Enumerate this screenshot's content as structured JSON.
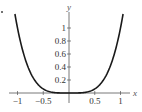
{
  "chart_data": {
    "type": "line",
    "title": "",
    "xlabel": "x",
    "ylabel": "y",
    "function": "y = x^4",
    "xlim": [
      -1.05,
      1.05
    ],
    "ylim": [
      0,
      1.2
    ],
    "grid": false,
    "legend": null,
    "x_ticks": [
      -1,
      -0.5,
      0.5,
      1
    ],
    "x_tick_labels": [
      "−1",
      "−0.5",
      "0.5",
      "1"
    ],
    "y_ticks": [
      0.2,
      0.4,
      0.6,
      0.8,
      1
    ],
    "y_tick_labels": [
      "0.2",
      "0.4",
      "0.6",
      "0.8",
      "1"
    ],
    "series": [
      {
        "name": "x^4",
        "x": [
          -1.05,
          -1,
          -0.9,
          -0.8,
          -0.7,
          -0.6,
          -0.5,
          -0.4,
          -0.3,
          -0.2,
          -0.1,
          0,
          0.1,
          0.2,
          0.3,
          0.4,
          0.5,
          0.6,
          0.7,
          0.8,
          0.9,
          1,
          1.05
        ],
        "values": [
          1.2155,
          1,
          0.6561,
          0.4096,
          0.2401,
          0.1296,
          0.0625,
          0.0256,
          0.0081,
          0.0016,
          0.0001,
          0,
          0.0001,
          0.0016,
          0.0081,
          0.0256,
          0.0625,
          0.1296,
          0.2401,
          0.4096,
          0.6561,
          1,
          1.2155
        ]
      }
    ],
    "colors": {
      "curve": "#1a1a1a",
      "axis": "#555555"
    }
  }
}
